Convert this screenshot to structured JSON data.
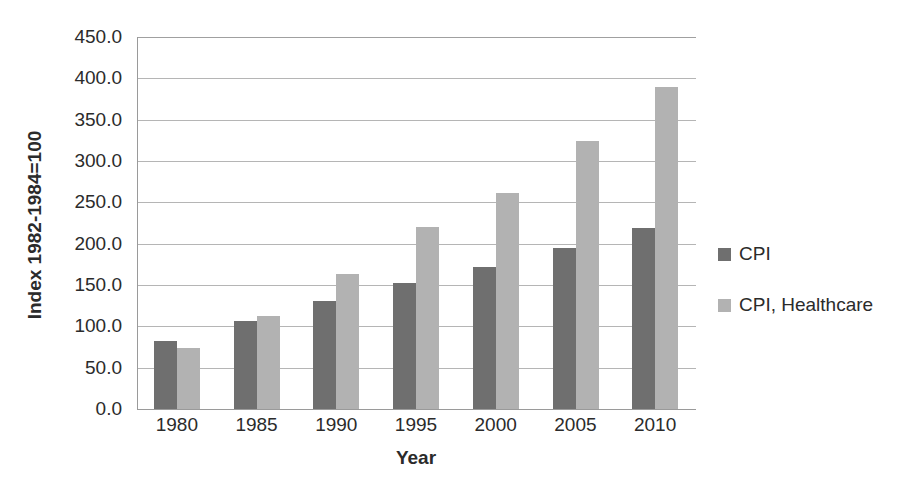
{
  "chart_data": {
    "type": "bar",
    "title": "",
    "xlabel": "Year",
    "ylabel": "Index 1982-1984=100",
    "categories": [
      "1980",
      "1985",
      "1990",
      "1995",
      "2000",
      "2005",
      "2010"
    ],
    "series": [
      {
        "name": "CPI",
        "color": "#6f6f6f",
        "values": [
          82,
          107,
          131,
          152,
          172,
          195,
          219
        ]
      },
      {
        "name": "CPI, Healthcare",
        "color": "#b2b2b2",
        "values": [
          74,
          113,
          163,
          220,
          261,
          324,
          389
        ]
      }
    ],
    "ylim": [
      0,
      450
    ],
    "y_ticks": [
      "0.0",
      "50.0",
      "100.0",
      "150.0",
      "200.0",
      "250.0",
      "300.0",
      "350.0",
      "400.0",
      "450.0"
    ],
    "y_tick_values": [
      0,
      50,
      100,
      150,
      200,
      250,
      300,
      350,
      400,
      450
    ],
    "grid": true,
    "legend_position": "right"
  },
  "legend": {
    "items": [
      {
        "label": "CPI",
        "color": "#6f6f6f"
      },
      {
        "label": "CPI, Healthcare",
        "color": "#b2b2b2"
      }
    ]
  },
  "colors": {
    "series_cpi": "#6f6f6f",
    "series_cpi_healthcare": "#b2b2b2",
    "axis": "#9a9a9a",
    "gridline": "#b5b5b5",
    "text": "#2b2b2b",
    "background": "#ffffff"
  }
}
